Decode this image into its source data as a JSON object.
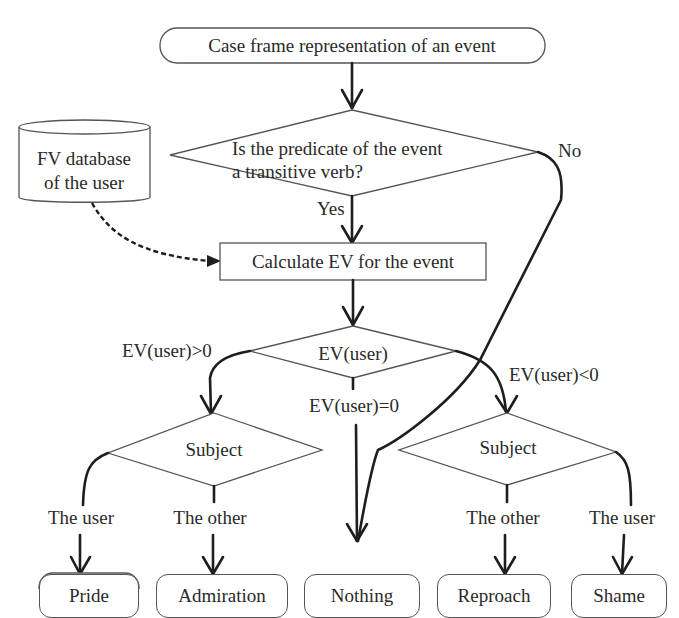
{
  "diagram": {
    "start": {
      "label": "Case frame representation of an event"
    },
    "decision_transitive": {
      "line1": "Is the predicate of the event",
      "line2": "a transitive verb?",
      "yes_label": "Yes",
      "no_label": "No"
    },
    "database": {
      "line1": "FV database",
      "line2": "of the user"
    },
    "process_calc": {
      "label": "Calculate EV for the event"
    },
    "decision_ev": {
      "label": "EV(user)",
      "positive_label": "EV(user)>0",
      "zero_label": "EV(user)=0",
      "negative_label": "EV(user)<0"
    },
    "decision_subject_left": {
      "label": "Subject",
      "branch_user": "The user",
      "branch_other": "The other"
    },
    "decision_subject_right": {
      "label": "Subject",
      "branch_other": "The other",
      "branch_user": "The user"
    },
    "outcomes": [
      {
        "label": "Pride"
      },
      {
        "label": "Admiration"
      },
      {
        "label": "Nothing"
      },
      {
        "label": "Reproach"
      },
      {
        "label": "Shame"
      }
    ]
  }
}
